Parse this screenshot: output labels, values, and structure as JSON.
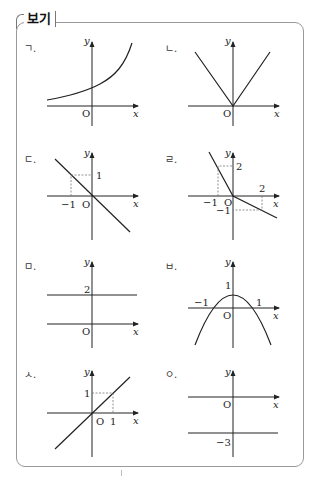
{
  "box": {
    "title": "보기"
  },
  "panels": [
    {
      "id": "g",
      "label": "ㄱ.",
      "type": "exponential-increasing",
      "origin": "O",
      "x_axis": "x",
      "y_axis": "y",
      "ticks": []
    },
    {
      "id": "n",
      "label": "ㄴ.",
      "type": "absolute-value-v",
      "origin": "O",
      "x_axis": "x",
      "y_axis": "y",
      "ticks": []
    },
    {
      "id": "d",
      "label": "ㄷ.",
      "type": "line",
      "origin": "O",
      "x_axis": "x",
      "y_axis": "y",
      "ticks": {
        "x_neg1": "−1",
        "y_1": "1"
      }
    },
    {
      "id": "r",
      "label": "ㄹ.",
      "type": "piecewise-line",
      "origin": "O",
      "x_axis": "x",
      "y_axis": "y",
      "ticks": {
        "x_neg1": "−1",
        "y_2": "2",
        "x_2": "2",
        "y_neg1": "−1"
      }
    },
    {
      "id": "m",
      "label": "ㅁ.",
      "type": "horizontal-line",
      "origin": "O",
      "x_axis": "x",
      "y_axis": "y",
      "ticks": {
        "y_2": "2"
      }
    },
    {
      "id": "b",
      "label": "ㅂ.",
      "type": "parabola-down",
      "origin": "O",
      "x_axis": "x",
      "y_axis": "y",
      "ticks": {
        "x_neg1": "−1",
        "x_1": "1",
        "y_1": "1"
      }
    },
    {
      "id": "s",
      "label": "ㅅ.",
      "type": "line",
      "origin": "O",
      "x_axis": "x",
      "y_axis": "y",
      "ticks": {
        "x_1": "1",
        "y_1": "1"
      }
    },
    {
      "id": "o",
      "label": "ㅇ.",
      "type": "horizontal-line",
      "origin": "O",
      "x_axis": "x",
      "y_axis": "y",
      "ticks": {
        "y_neg3": "−3"
      }
    }
  ]
}
